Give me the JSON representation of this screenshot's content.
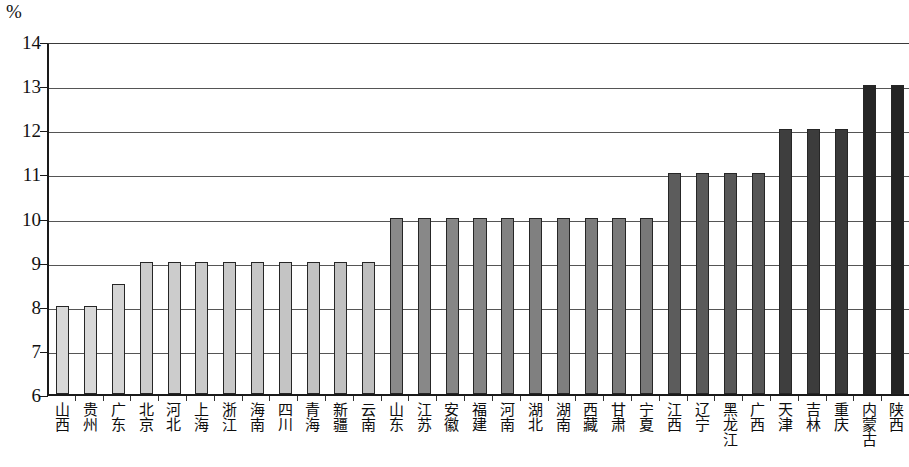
{
  "unit_label": "%",
  "chart_data": {
    "type": "bar",
    "title": "",
    "subtitle": "",
    "xlabel": "",
    "ylabel": "%",
    "ylim": [
      6,
      14
    ],
    "ytick_labels": [
      "14",
      "13",
      "12",
      "11",
      "10",
      "9",
      "8",
      "7",
      "6"
    ],
    "ytick_values": [
      14,
      13,
      12,
      11,
      10,
      9,
      8,
      7,
      6
    ],
    "grid": true,
    "legend": "none",
    "categories": [
      "山西",
      "贵州",
      "广东",
      "北京",
      "河北",
      "上海",
      "浙江",
      "海南",
      "四川",
      "青海",
      "新疆",
      "云南",
      "山东",
      "江苏",
      "安徽",
      "福建",
      "河南",
      "湖北",
      "湖南",
      "西藏",
      "甘肃",
      "宁夏",
      "江西",
      "辽宁",
      "黑龙江",
      "广西",
      "天津",
      "吉林",
      "重庆",
      "内蒙古",
      "陕西"
    ],
    "values": [
      8,
      8,
      8.5,
      9,
      9,
      9,
      9,
      9,
      9,
      9,
      9,
      9,
      10,
      10,
      10,
      10,
      10,
      10,
      10,
      10,
      10,
      10,
      11,
      11,
      11,
      11,
      12,
      12,
      12,
      13,
      13
    ],
    "bar_colors": [
      "#d8d8d8",
      "#d8d8d8",
      "#d4d4d4",
      "#cccccc",
      "#cccccc",
      "#cacaca",
      "#c8c8c8",
      "#c6c6c6",
      "#c4c4c4",
      "#c2c2c2",
      "#c0c0c0",
      "#bebebe",
      "#8a8a8a",
      "#888888",
      "#868686",
      "#848484",
      "#828282",
      "#808080",
      "#7e7e7e",
      "#7c7c7c",
      "#7a7a7a",
      "#787878",
      "#5c5c5c",
      "#5a5a5a",
      "#585858",
      "#565656",
      "#3e3e3e",
      "#3c3c3c",
      "#3a3a3a",
      "#262626",
      "#242424"
    ],
    "bar_border_color": "#262626",
    "gridline_color": "#555555",
    "axis_color": "#1a1a1a",
    "background_color": "#ffffff"
  }
}
